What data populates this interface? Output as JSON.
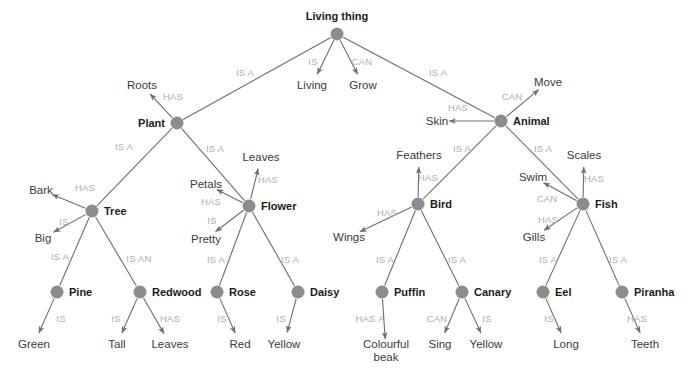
{
  "diagram": {
    "node_color": "#8c8c8c",
    "edge_color": "#6e6e6e",
    "edge_label_color": "#adadad",
    "text_color": "#1b1b1b",
    "background": "#ffffff",
    "node_radius": 6.5
  },
  "concepts": [
    {
      "id": "living-thing",
      "label": "Living thing",
      "x": 337,
      "y": 34,
      "label_dx": 0,
      "label_dy": -18,
      "label_anchor": "middle"
    },
    {
      "id": "plant",
      "label": "Plant",
      "x": 177,
      "y": 123,
      "label_dx": -12,
      "label_dy": 0,
      "label_anchor": "end"
    },
    {
      "id": "animal",
      "label": "Animal",
      "x": 501,
      "y": 121,
      "label_dx": 12,
      "label_dy": 0,
      "label_anchor": "start"
    },
    {
      "id": "tree",
      "label": "Tree",
      "x": 92,
      "y": 211,
      "label_dx": 12,
      "label_dy": 0,
      "label_anchor": "start"
    },
    {
      "id": "flower",
      "label": "Flower",
      "x": 249,
      "y": 206,
      "label_dx": 12,
      "label_dy": 0,
      "label_anchor": "start"
    },
    {
      "id": "bird",
      "label": "Bird",
      "x": 418,
      "y": 204,
      "label_dx": 12,
      "label_dy": 0,
      "label_anchor": "start"
    },
    {
      "id": "fish",
      "label": "Fish",
      "x": 583,
      "y": 204,
      "label_dx": 12,
      "label_dy": 0,
      "label_anchor": "start"
    },
    {
      "id": "pine",
      "label": "Pine",
      "x": 57,
      "y": 292,
      "label_dx": 12,
      "label_dy": 0,
      "label_anchor": "start"
    },
    {
      "id": "redwood",
      "label": "Redwood",
      "x": 140,
      "y": 292,
      "label_dx": 12,
      "label_dy": 0,
      "label_anchor": "start"
    },
    {
      "id": "rose",
      "label": "Rose",
      "x": 217,
      "y": 292,
      "label_dx": 12,
      "label_dy": 0,
      "label_anchor": "start"
    },
    {
      "id": "daisy",
      "label": "Daisy",
      "x": 298,
      "y": 292,
      "label_dx": 12,
      "label_dy": 0,
      "label_anchor": "start"
    },
    {
      "id": "puffin",
      "label": "Puffin",
      "x": 382,
      "y": 292,
      "label_dx": 12,
      "label_dy": 0,
      "label_anchor": "start"
    },
    {
      "id": "canary",
      "label": "Canary",
      "x": 462,
      "y": 292,
      "label_dx": 12,
      "label_dy": 0,
      "label_anchor": "start"
    },
    {
      "id": "eel",
      "label": "Eel",
      "x": 543,
      "y": 292,
      "label_dx": 12,
      "label_dy": 0,
      "label_anchor": "start"
    },
    {
      "id": "piranha",
      "label": "Piranha",
      "x": 622,
      "y": 292,
      "label_dx": 12,
      "label_dy": 0,
      "label_anchor": "start"
    }
  ],
  "attributes": [
    {
      "id": "attr-living",
      "label": "Living",
      "x": 312,
      "y": 85
    },
    {
      "id": "attr-grow",
      "label": "Grow",
      "x": 363,
      "y": 85
    },
    {
      "id": "attr-roots",
      "label": "Roots",
      "x": 142,
      "y": 85
    },
    {
      "id": "attr-skin",
      "label": "Skin",
      "x": 437,
      "y": 121
    },
    {
      "id": "attr-move",
      "label": "Move",
      "x": 548,
      "y": 82
    },
    {
      "id": "attr-bark",
      "label": "Bark",
      "x": 41,
      "y": 190
    },
    {
      "id": "attr-big",
      "label": "Big",
      "x": 43,
      "y": 238
    },
    {
      "id": "attr-leaves-flower",
      "label": "Leaves",
      "x": 261,
      "y": 157
    },
    {
      "id": "attr-petals",
      "label": "Petals",
      "x": 206,
      "y": 184
    },
    {
      "id": "attr-pretty",
      "label": "Pretty",
      "x": 206,
      "y": 239
    },
    {
      "id": "attr-feathers",
      "label": "Feathers",
      "x": 419,
      "y": 155
    },
    {
      "id": "attr-wings",
      "label": "Wings",
      "x": 349,
      "y": 237
    },
    {
      "id": "attr-scales",
      "label": "Scales",
      "x": 584,
      "y": 155
    },
    {
      "id": "attr-swim",
      "label": "Swim",
      "x": 533,
      "y": 177
    },
    {
      "id": "attr-gills",
      "label": "Gills",
      "x": 534,
      "y": 237
    },
    {
      "id": "attr-green",
      "label": "Green",
      "x": 34,
      "y": 344
    },
    {
      "id": "attr-tall",
      "label": "Tall",
      "x": 117,
      "y": 344
    },
    {
      "id": "attr-leaves-redwood",
      "label": "Leaves",
      "x": 170,
      "y": 344
    },
    {
      "id": "attr-red",
      "label": "Red",
      "x": 240,
      "y": 344
    },
    {
      "id": "attr-yellow-daisy",
      "label": "Yellow",
      "x": 284,
      "y": 344
    },
    {
      "id": "attr-colourful-beak",
      "label": "Colourful\nbeak",
      "x": 386,
      "y": 351
    },
    {
      "id": "attr-sing",
      "label": "Sing",
      "x": 440,
      "y": 344
    },
    {
      "id": "attr-yellow-canary",
      "label": "Yellow",
      "x": 486,
      "y": 344
    },
    {
      "id": "attr-long",
      "label": "Long",
      "x": 566,
      "y": 344
    },
    {
      "id": "attr-teeth",
      "label": "Teeth",
      "x": 645,
      "y": 344
    }
  ],
  "edges": [
    {
      "id": "e-lt-plant",
      "from": "living-thing",
      "to": "plant",
      "relation": "IS A",
      "lx": 245,
      "ly": 72,
      "arrow": false
    },
    {
      "id": "e-lt-animal",
      "from": "living-thing",
      "to": "animal",
      "relation": "IS A",
      "lx": 438,
      "ly": 72,
      "arrow": false
    },
    {
      "id": "e-lt-living",
      "from": "living-thing",
      "to": "attr-living",
      "relation": "IS",
      "lx": 313,
      "ly": 61,
      "arrow": true
    },
    {
      "id": "e-lt-grow",
      "from": "living-thing",
      "to": "attr-grow",
      "relation": "CAN",
      "lx": 362,
      "ly": 61,
      "arrow": true
    },
    {
      "id": "e-plant-roots",
      "from": "plant",
      "to": "attr-roots",
      "relation": "HAS",
      "lx": 173,
      "ly": 96,
      "arrow": true
    },
    {
      "id": "e-plant-tree",
      "from": "plant",
      "to": "tree",
      "relation": "IS A",
      "lx": 124,
      "ly": 146,
      "arrow": false
    },
    {
      "id": "e-plant-flower",
      "from": "plant",
      "to": "flower",
      "relation": "IS A",
      "lx": 215,
      "ly": 148,
      "arrow": false
    },
    {
      "id": "e-animal-skin",
      "from": "animal",
      "to": "attr-skin",
      "relation": "HAS",
      "lx": 458,
      "ly": 107,
      "arrow": true
    },
    {
      "id": "e-animal-move",
      "from": "animal",
      "to": "attr-move",
      "relation": "CAN",
      "lx": 512,
      "ly": 96,
      "arrow": true
    },
    {
      "id": "e-animal-bird",
      "from": "animal",
      "to": "bird",
      "relation": "IS A",
      "lx": 462,
      "ly": 148,
      "arrow": false
    },
    {
      "id": "e-animal-fish",
      "from": "animal",
      "to": "fish",
      "relation": "IS A",
      "lx": 543,
      "ly": 148,
      "arrow": false
    },
    {
      "id": "e-tree-bark",
      "from": "tree",
      "to": "attr-bark",
      "relation": "HAS",
      "lx": 85,
      "ly": 187,
      "arrow": true
    },
    {
      "id": "e-tree-big",
      "from": "tree",
      "to": "attr-big",
      "relation": "IS",
      "lx": 64,
      "ly": 221,
      "arrow": true
    },
    {
      "id": "e-tree-pine",
      "from": "tree",
      "to": "pine",
      "relation": "IS A",
      "lx": 60,
      "ly": 256,
      "arrow": false
    },
    {
      "id": "e-tree-redwood",
      "from": "tree",
      "to": "redwood",
      "relation": "IS AN",
      "lx": 139,
      "ly": 258,
      "arrow": false
    },
    {
      "id": "e-flower-leaves",
      "from": "flower",
      "to": "attr-leaves-flower",
      "relation": "HAS",
      "lx": 268,
      "ly": 179,
      "arrow": true
    },
    {
      "id": "e-flower-petals",
      "from": "flower",
      "to": "attr-petals",
      "relation": "HAS",
      "lx": 211,
      "ly": 201,
      "arrow": true
    },
    {
      "id": "e-flower-pretty",
      "from": "flower",
      "to": "attr-pretty",
      "relation": "IS",
      "lx": 212,
      "ly": 220,
      "arrow": true
    },
    {
      "id": "e-flower-rose",
      "from": "flower",
      "to": "rose",
      "relation": "IS A",
      "lx": 216,
      "ly": 259,
      "arrow": false
    },
    {
      "id": "e-flower-daisy",
      "from": "flower",
      "to": "daisy",
      "relation": "IS A",
      "lx": 290,
      "ly": 259,
      "arrow": false
    },
    {
      "id": "e-bird-feathers",
      "from": "bird",
      "to": "attr-feathers",
      "relation": "HAS",
      "lx": 428,
      "ly": 177,
      "arrow": true
    },
    {
      "id": "e-bird-wings",
      "from": "bird",
      "to": "attr-wings",
      "relation": "HAS",
      "lx": 387,
      "ly": 212,
      "arrow": true
    },
    {
      "id": "e-bird-puffin",
      "from": "bird",
      "to": "puffin",
      "relation": "IS A",
      "lx": 385,
      "ly": 259,
      "arrow": false
    },
    {
      "id": "e-bird-canary",
      "from": "bird",
      "to": "canary",
      "relation": "IS A",
      "lx": 457,
      "ly": 259,
      "arrow": false
    },
    {
      "id": "e-fish-scales",
      "from": "fish",
      "to": "attr-scales",
      "relation": "HAS",
      "lx": 594,
      "ly": 178,
      "arrow": true
    },
    {
      "id": "e-fish-swim",
      "from": "fish",
      "to": "attr-swim",
      "relation": "CAN",
      "lx": 547,
      "ly": 198,
      "arrow": true
    },
    {
      "id": "e-fish-gills",
      "from": "fish",
      "to": "attr-gills",
      "relation": "HAS",
      "lx": 548,
      "ly": 219,
      "arrow": true
    },
    {
      "id": "e-fish-eel",
      "from": "fish",
      "to": "eel",
      "relation": "IS A",
      "lx": 548,
      "ly": 259,
      "arrow": false
    },
    {
      "id": "e-fish-piranha",
      "from": "fish",
      "to": "piranha",
      "relation": "IS A",
      "lx": 618,
      "ly": 259,
      "arrow": false
    },
    {
      "id": "e-pine-green",
      "from": "pine",
      "to": "attr-green",
      "relation": "IS",
      "lx": 61,
      "ly": 318,
      "arrow": true
    },
    {
      "id": "e-redwood-tall",
      "from": "redwood",
      "to": "attr-tall",
      "relation": "IS",
      "lx": 116,
      "ly": 318,
      "arrow": true
    },
    {
      "id": "e-redwood-leaves",
      "from": "redwood",
      "to": "attr-leaves-redwood",
      "relation": "HAS",
      "lx": 170,
      "ly": 318,
      "arrow": true
    },
    {
      "id": "e-rose-red",
      "from": "rose",
      "to": "attr-red",
      "relation": "IS",
      "lx": 222,
      "ly": 318,
      "arrow": true
    },
    {
      "id": "e-daisy-yellow",
      "from": "daisy",
      "to": "attr-yellow-daisy",
      "relation": "IS",
      "lx": 281,
      "ly": 318,
      "arrow": true
    },
    {
      "id": "e-puffin-beak",
      "from": "puffin",
      "to": "attr-colourful-beak",
      "relation": "HAS A",
      "lx": 370,
      "ly": 318,
      "arrow": true
    },
    {
      "id": "e-canary-sing",
      "from": "canary",
      "to": "attr-sing",
      "relation": "CAN",
      "lx": 437,
      "ly": 318,
      "arrow": true
    },
    {
      "id": "e-canary-yellow",
      "from": "canary",
      "to": "attr-yellow-canary",
      "relation": "IS",
      "lx": 487,
      "ly": 318,
      "arrow": true
    },
    {
      "id": "e-eel-long",
      "from": "eel",
      "to": "attr-long",
      "relation": "IS",
      "lx": 549,
      "ly": 318,
      "arrow": true
    },
    {
      "id": "e-piranha-teeth",
      "from": "piranha",
      "to": "attr-teeth",
      "relation": "HAS",
      "lx": 637,
      "ly": 318,
      "arrow": true
    }
  ]
}
